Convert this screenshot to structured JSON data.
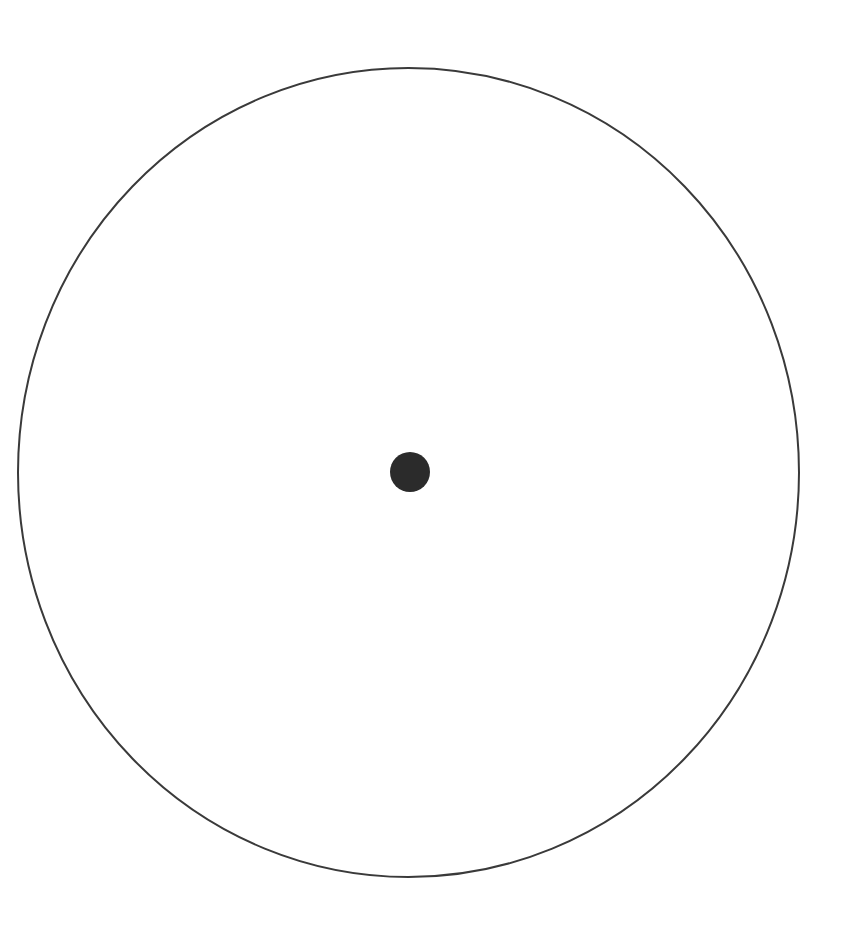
{
  "diagram": {
    "background": "#ffffff",
    "outer_circle": {
      "cx": 408.5,
      "cy": 472.5,
      "rx": 390.5,
      "ry": 404.5,
      "stroke": "#3a3a3a",
      "stroke_width": 2,
      "fill": "none"
    },
    "center_dot": {
      "cx": 410,
      "cy": 472,
      "r": 20,
      "fill": "#2b2b2b"
    }
  }
}
